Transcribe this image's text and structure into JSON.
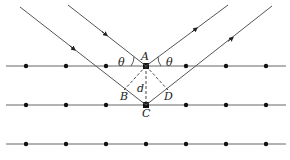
{
  "diagram": {
    "type": "bragg-diffraction",
    "labels": {
      "A": "A",
      "B": "B",
      "C": "C",
      "D": "D",
      "d": "d",
      "theta_left": "θ",
      "theta_right": "θ"
    },
    "lattice": {
      "rows_y": [
        66,
        105,
        144
      ],
      "dots_x": [
        26,
        66,
        106,
        146,
        186,
        226,
        266
      ],
      "line_x_start": 6,
      "line_x_end": 286
    },
    "colors": {
      "line": "#555555",
      "dot": "#111111",
      "dashed": "#333333",
      "text": "#222222"
    }
  }
}
